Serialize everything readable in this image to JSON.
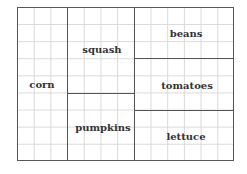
{
  "diagram": {
    "title": "",
    "type": "garden-plot-layout",
    "grid": {
      "columns": 13,
      "rows": 9
    },
    "regions": [
      {
        "name": "corn",
        "label": "corn",
        "x": 42,
        "y": 84
      },
      {
        "name": "squash",
        "label": "squash",
        "x": 102,
        "y": 49
      },
      {
        "name": "pumpkins",
        "label": "pumpkins",
        "x": 103,
        "y": 127
      },
      {
        "name": "beans",
        "label": "beans",
        "x": 186,
        "y": 33
      },
      {
        "name": "tomatoes",
        "label": "tomatoes",
        "x": 187,
        "y": 85
      },
      {
        "name": "lettuce",
        "label": "lettuce",
        "x": 186,
        "y": 136
      }
    ]
  },
  "colors": {
    "border": "#555555",
    "gridline": "#d9d9d9",
    "text": "#333333",
    "background": "#ffffff"
  }
}
